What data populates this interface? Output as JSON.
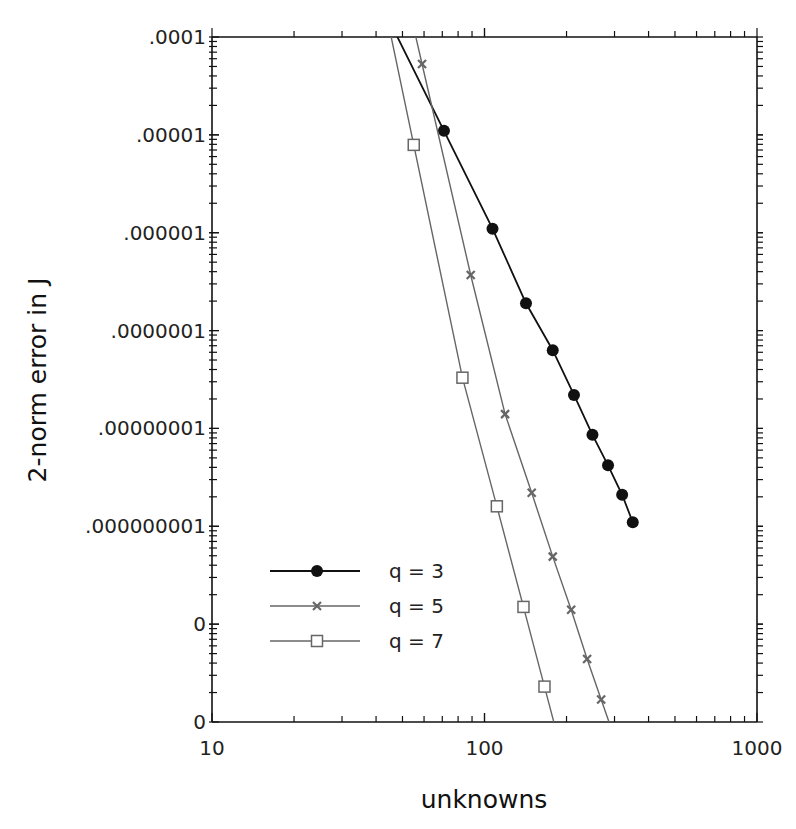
{
  "chart_data": {
    "type": "line",
    "title": "",
    "xlabel": "unknowns",
    "ylabel": "2-norm error in J",
    "xscale": "log",
    "yscale": "log",
    "xlim": [
      10,
      1000
    ],
    "ylim": [
      1e-11,
      0.0001
    ],
    "grid": false,
    "legend_position": "lower-left",
    "x_tick_labels": [
      "10",
      "100",
      "1000"
    ],
    "y_tick_labels": [
      ".0001",
      ".00001",
      ".000001",
      ".0000001",
      ".00000001",
      ".000000001",
      "0",
      "0"
    ],
    "series": [
      {
        "name": "q = 3",
        "marker": "filled-circle",
        "color": "#111111",
        "x": [
          71,
          107,
          142,
          178,
          213,
          249,
          284,
          320,
          350
        ],
        "y": [
          1.1e-05,
          1.1e-06,
          1.9e-07,
          6.3e-08,
          2.2e-08,
          8.6e-09,
          4.2e-09,
          2.1e-09,
          1.1e-09
        ]
      },
      {
        "name": "q = 5",
        "marker": "x",
        "color": "#666666",
        "x": [
          59,
          89,
          119,
          149,
          178,
          208,
          238,
          268
        ],
        "y": [
          5.3e-05,
          3.7e-07,
          1.4e-08,
          2.2e-09,
          4.9e-10,
          1.4e-10,
          4.4e-11,
          1.7e-11
        ]
      },
      {
        "name": "q = 7",
        "marker": "open-square",
        "color": "#666666",
        "x": [
          55,
          83,
          111,
          139,
          166
        ],
        "y": [
          7.9e-06,
          3.3e-08,
          1.6e-09,
          1.5e-10,
          2.3e-11
        ]
      }
    ]
  },
  "labels": {
    "xlabel": "unknowns",
    "ylabel": "2-norm error in J",
    "xticks": [
      "10",
      "100",
      "1000"
    ],
    "yticks": [
      ".0001",
      ".00001",
      ".000001",
      ".0000001",
      ".00000001",
      ".000000001",
      "0",
      "0"
    ],
    "legend": [
      "q = 3",
      "q = 5",
      "q = 7"
    ]
  }
}
